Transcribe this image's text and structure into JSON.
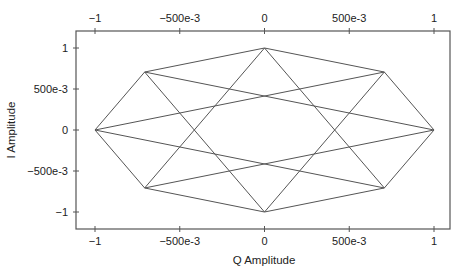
{
  "chart_data": {
    "type": "line",
    "title": "",
    "xlabel": "Q Amplitude",
    "ylabel": "I Amplitude",
    "xlim": [
      -1.1,
      1.1
    ],
    "ylim": [
      -1.25,
      1.25
    ],
    "grid": false,
    "legend": null,
    "x_ticks": [
      -1,
      -0.5,
      0,
      0.5,
      1
    ],
    "x_tick_labels": [
      "−1",
      "−500e-3",
      "0",
      "500e-3",
      "1"
    ],
    "y_ticks": [
      1,
      0.5,
      0,
      -0.5,
      -1
    ],
    "y_tick_labels": [
      "1",
      "500e-3",
      "0",
      "−500e-3",
      "−1"
    ],
    "points": [
      {
        "q": 1.0,
        "i": 0.0
      },
      {
        "q": 0.707,
        "i": 0.707
      },
      {
        "q": 0.0,
        "i": 1.0
      },
      {
        "q": -0.707,
        "i": 0.707
      },
      {
        "q": -1.0,
        "i": 0.0
      },
      {
        "q": -0.707,
        "i": -0.707
      },
      {
        "q": 0.0,
        "i": -1.0
      },
      {
        "q": 0.707,
        "i": -0.707
      }
    ],
    "connections_description": "8-PSK trajectory: each symbol connects to its two neighbors and the two symbols 135 degrees away",
    "segments": [
      [
        0,
        1
      ],
      [
        1,
        2
      ],
      [
        2,
        3
      ],
      [
        3,
        4
      ],
      [
        4,
        5
      ],
      [
        5,
        6
      ],
      [
        6,
        7
      ],
      [
        7,
        0
      ],
      [
        0,
        3
      ],
      [
        1,
        4
      ],
      [
        2,
        5
      ],
      [
        3,
        6
      ],
      [
        4,
        7
      ],
      [
        5,
        0
      ],
      [
        6,
        1
      ],
      [
        7,
        2
      ]
    ],
    "line_color": "#555555",
    "frame_color": "#555555"
  }
}
